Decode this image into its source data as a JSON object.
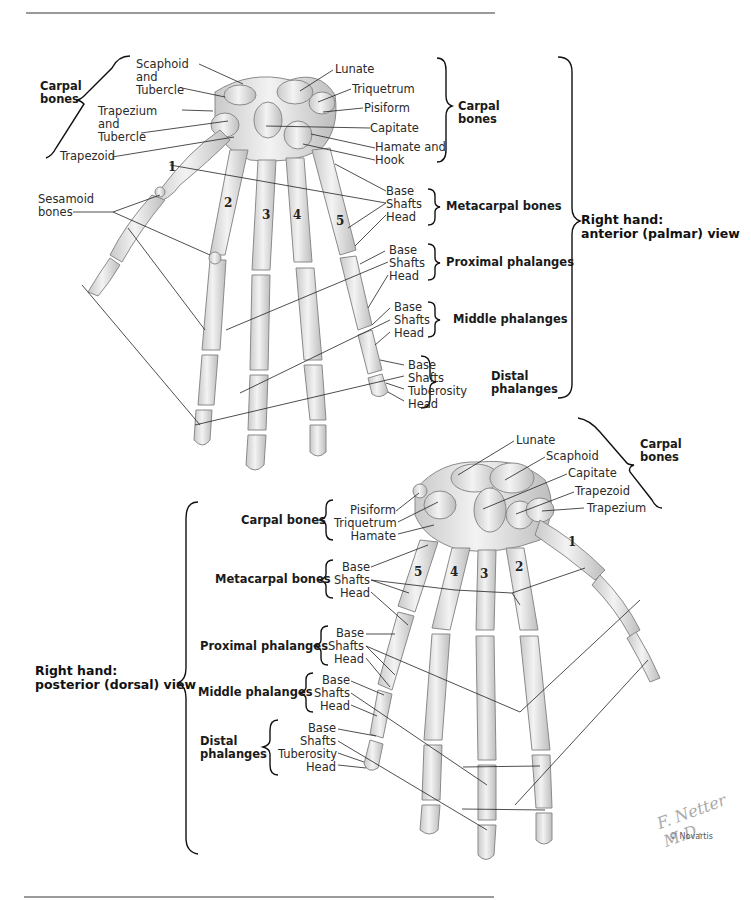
{
  "figure": {
    "credit": "© Novartis",
    "signature": "F. Netter M.D."
  },
  "anterior_view": {
    "title_line1": "Right hand:",
    "title_line2": "anterior (palmar) view",
    "carpal_left": {
      "group_line1": "Carpal",
      "group_line2": "bones",
      "labels": [
        "Scaphoid",
        "and",
        "Tubercle",
        "Trapezium",
        "and",
        "Tubercle",
        "Trapezoid"
      ]
    },
    "carpal_right": {
      "group_line1": "Carpal",
      "group_line2": "bones",
      "labels": [
        "Lunate",
        "Triquetrum",
        "Pisiform",
        "Capitate",
        "Hamate and",
        "Hook"
      ]
    },
    "sesamoid": {
      "line1": "Sesamoid",
      "line2": "bones"
    },
    "metacarpal": {
      "group": "Metacarpal bones",
      "labels": [
        "Base",
        "Shafts",
        "Head"
      ]
    },
    "proximal": {
      "group": "Proximal phalanges",
      "labels": [
        "Base",
        "Shafts",
        "Head"
      ]
    },
    "middle": {
      "group": "Middle phalanges",
      "labels": [
        "Base",
        "Shafts",
        "Head"
      ]
    },
    "distal": {
      "group_line1": "Distal",
      "group_line2": "phalanges",
      "labels": [
        "Base",
        "Shafts",
        "Tuberosity",
        "Head"
      ]
    },
    "digit_numbers": [
      "1",
      "2",
      "3",
      "4",
      "5"
    ]
  },
  "posterior_view": {
    "title_line1": "Right hand:",
    "title_line2": "posterior (dorsal) view",
    "carpal_right": {
      "group_line1": "Carpal",
      "group_line2": "bones",
      "labels": [
        "Lunate",
        "Scaphoid",
        "Capitate",
        "Trapezoid",
        "Trapezium"
      ]
    },
    "carpal_left": {
      "group": "Carpal bones",
      "labels": [
        "Pisiform",
        "Triquetrum",
        "Hamate"
      ]
    },
    "metacarpal": {
      "group": "Metacarpal bones",
      "labels": [
        "Base",
        "Shafts",
        "Head"
      ]
    },
    "proximal": {
      "group": "Proximal phalanges",
      "labels": [
        "Base",
        "Shafts",
        "Head"
      ]
    },
    "middle": {
      "group": "Middle phalanges",
      "labels": [
        "Base",
        "Shafts",
        "Head"
      ]
    },
    "distal": {
      "group_line1": "Distal",
      "group_line2": "phalanges",
      "labels": [
        "Base",
        "Shafts",
        "Tuberosity",
        "Head"
      ]
    },
    "digit_numbers": [
      "5",
      "4",
      "3",
      "2",
      "1"
    ]
  }
}
